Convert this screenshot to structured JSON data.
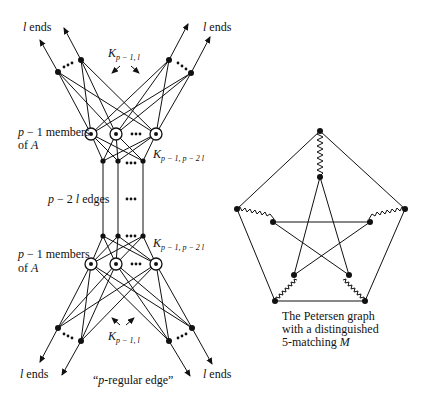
{
  "left_diagram": {
    "title": "\"p-regular edge\"",
    "labels": {
      "top_left_ends": "l ends",
      "top_right_ends": "l ends",
      "bottom_left_ends": "l ends",
      "bottom_right_ends": "l ends",
      "top_k": "K",
      "top_k_sub": "p − 1, l",
      "upper_members_line1": "p − 1 members",
      "upper_members_line2": "of A",
      "upper_k": "K",
      "upper_k_sub": "p − 1, p − 2 l",
      "edges": "p − 2 l edges",
      "lower_members_line1": "p − 1 members",
      "lower_members_line2": "of A",
      "lower_k": "K",
      "lower_k_sub": "p − 1, p − 2 l",
      "bottom_k": "K",
      "bottom_k_sub": "p − 1, l",
      "caption": "\"p-regular edge\""
    },
    "ellipsis": "•••"
  },
  "right_diagram": {
    "caption_line1": "The Petersen graph",
    "caption_line2": "with a distinguished",
    "caption_line3": "5-matching M",
    "outer_vertices": 5,
    "inner_vertices": 5,
    "matching_edges": 5
  }
}
